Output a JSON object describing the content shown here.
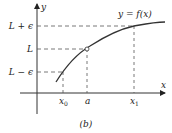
{
  "diagram": {
    "caption": "(b)",
    "axes": {
      "x_label": "x",
      "y_label": "y"
    },
    "curve_label": "y = f(x)",
    "y_ticks": [
      {
        "label": "L + ϵ",
        "y": 26
      },
      {
        "label": "L",
        "y": 49
      },
      {
        "label": "L − ϵ",
        "y": 72
      }
    ],
    "x_ticks": [
      {
        "label": "x",
        "sub": "0",
        "x": 63
      },
      {
        "label": "a",
        "sub": "",
        "x": 87
      },
      {
        "label": "x",
        "sub": "1",
        "x": 134
      }
    ],
    "open_point": {
      "x": 87,
      "y": 49
    },
    "colors": {
      "axis": "#333333",
      "curve": "#333333",
      "dashes": "#555555",
      "open_point_fill": "#ffffff"
    }
  }
}
